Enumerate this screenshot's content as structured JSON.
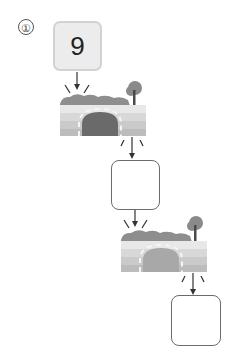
{
  "problem": {
    "number_label": "①",
    "start_value": "9",
    "answer_boxes": [
      "",
      ""
    ]
  },
  "colors": {
    "start_box_fill": "#ececec",
    "start_box_border": "#d2d2d2",
    "answer_box_border": "#6b6b6b",
    "arrow": "#333333",
    "bush": "#8e8e8e",
    "tunnel": "#6a6a6a",
    "wall_light": "#e6e6e6",
    "wall_mid": "#cfcfcf",
    "wall_dark": "#b6b6b6"
  }
}
